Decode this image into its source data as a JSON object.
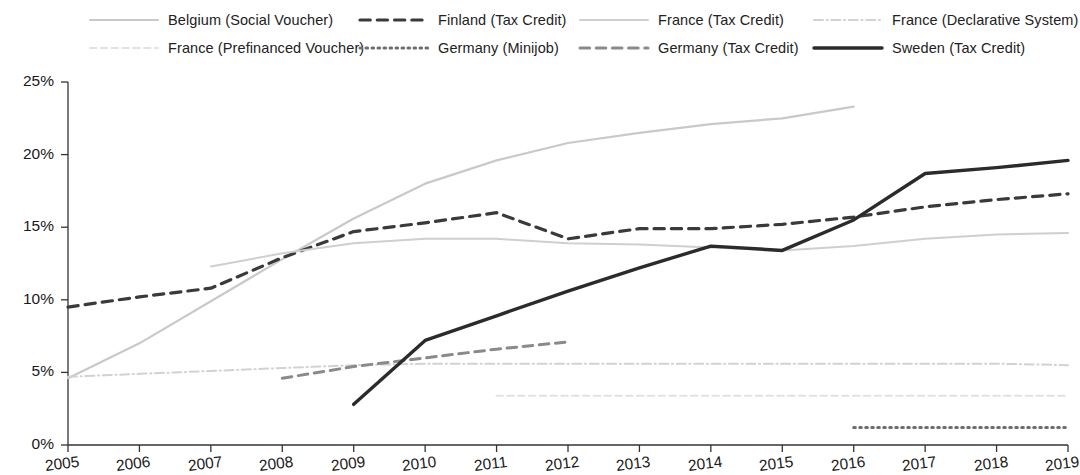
{
  "chart_data": {
    "type": "line",
    "title": "",
    "subtitle": "",
    "xlabel": "",
    "ylabel": "",
    "x": [
      2005,
      2006,
      2007,
      2008,
      2009,
      2010,
      2011,
      2012,
      2013,
      2014,
      2015,
      2016,
      2017,
      2018,
      2019
    ],
    "xtick_labels": [
      "2005",
      "2006",
      "2007",
      "2008",
      "2009",
      "2010",
      "2011",
      "2012",
      "2013",
      "2014",
      "2015",
      "2016",
      "2017",
      "2018",
      "2019"
    ],
    "ytick_labels": [
      "0%",
      "5%",
      "10%",
      "15%",
      "20%",
      "25%"
    ],
    "ytick_values": [
      0,
      5,
      10,
      15,
      20,
      25
    ],
    "ylim": [
      0,
      25
    ],
    "xlim": [
      2005,
      2019
    ],
    "grid": false,
    "legend_position": "top",
    "value_unit": "%",
    "series": [
      {
        "name": "Belgium (Social Voucher)",
        "style": "solid",
        "color": "#c9c9c9",
        "width": 2.2,
        "x": [
          2005,
          2006,
          2007,
          2008,
          2009,
          2010,
          2011,
          2012,
          2013,
          2014,
          2015,
          2016
        ],
        "values": [
          4.6,
          7.0,
          9.9,
          12.8,
          15.6,
          18.0,
          19.6,
          20.8,
          21.5,
          22.1,
          22.5,
          23.3
        ]
      },
      {
        "name": "Finland (Tax Credit)",
        "style": "dashed",
        "color": "#3a3a3a",
        "width": 3.2,
        "x": [
          2005,
          2006,
          2007,
          2008,
          2009,
          2010,
          2011,
          2012,
          2013,
          2014,
          2015,
          2016,
          2017,
          2018,
          2019
        ],
        "values": [
          9.5,
          10.2,
          10.8,
          12.9,
          14.7,
          15.3,
          16.0,
          14.2,
          14.9,
          14.9,
          15.2,
          15.7,
          16.4,
          16.9,
          17.3
        ]
      },
      {
        "name": "France (Tax Credit)",
        "style": "solid",
        "color": "#cfcfcf",
        "width": 2.0,
        "x": [
          2007,
          2008,
          2009,
          2010,
          2011,
          2012,
          2013,
          2014,
          2015,
          2016,
          2017,
          2018,
          2019
        ],
        "values": [
          12.3,
          13.2,
          13.9,
          14.2,
          14.2,
          13.9,
          13.8,
          13.6,
          13.4,
          13.7,
          14.2,
          14.5,
          14.6
        ]
      },
      {
        "name": "France (Declarative System)",
        "style": "dashdot",
        "color": "#d2d2d2",
        "width": 2.0,
        "x": [
          2005,
          2006,
          2007,
          2008,
          2009,
          2010,
          2011,
          2012,
          2013,
          2014,
          2015,
          2016,
          2017,
          2018,
          2019
        ],
        "values": [
          4.7,
          4.9,
          5.1,
          5.3,
          5.5,
          5.6,
          5.6,
          5.6,
          5.6,
          5.6,
          5.6,
          5.6,
          5.6,
          5.6,
          5.5
        ]
      },
      {
        "name": "France (Prefinanced Voucher)",
        "style": "dashed",
        "color": "#e2e2e2",
        "width": 2.0,
        "x": [
          2011,
          2012,
          2013,
          2014,
          2015,
          2016,
          2017,
          2018,
          2019
        ],
        "values": [
          3.4,
          3.4,
          3.4,
          3.4,
          3.4,
          3.4,
          3.4,
          3.4,
          3.4
        ]
      },
      {
        "name": "Germany (Minijob)",
        "style": "dotted",
        "color": "#6e6e6e",
        "width": 3.0,
        "x": [
          2016,
          2017,
          2018,
          2019
        ],
        "values": [
          1.2,
          1.2,
          1.2,
          1.2
        ]
      },
      {
        "name": "Germany (Tax Credit)",
        "style": "dashed",
        "color": "#8a8a8a",
        "width": 3.0,
        "x": [
          2008,
          2009,
          2010,
          2011,
          2012
        ],
        "values": [
          4.6,
          5.4,
          6.0,
          6.6,
          7.1
        ]
      },
      {
        "name": "Sweden (Tax Credit)",
        "style": "solid",
        "color": "#2b2b2b",
        "width": 3.4,
        "x": [
          2009,
          2010,
          2011,
          2012,
          2013,
          2014,
          2015,
          2016,
          2017,
          2018,
          2019
        ],
        "values": [
          2.8,
          7.2,
          8.9,
          10.6,
          12.2,
          13.7,
          13.4,
          15.5,
          18.7,
          19.1,
          19.6
        ]
      }
    ]
  },
  "legend": {
    "items": [
      {
        "label": "Belgium (Social Voucher)",
        "series": 0,
        "row": 0,
        "col": 0
      },
      {
        "label": "Finland (Tax Credit)",
        "series": 1,
        "row": 0,
        "col": 1
      },
      {
        "label": "France (Tax Credit)",
        "series": 2,
        "row": 0,
        "col": 2
      },
      {
        "label": "France (Declarative System)",
        "series": 3,
        "row": 0,
        "col": 3
      },
      {
        "label": "France (Prefinanced Voucher)",
        "series": 4,
        "row": 1,
        "col": 0
      },
      {
        "label": "Germany (Minijob)",
        "series": 5,
        "row": 1,
        "col": 1
      },
      {
        "label": "Germany (Tax Credit)",
        "series": 6,
        "row": 1,
        "col": 2
      },
      {
        "label": "Sweden (Tax Credit)",
        "series": 7,
        "row": 1,
        "col": 3
      }
    ]
  },
  "axis": {
    "y_axis_name": "percentage-axis",
    "x_axis_name": "year-axis"
  }
}
